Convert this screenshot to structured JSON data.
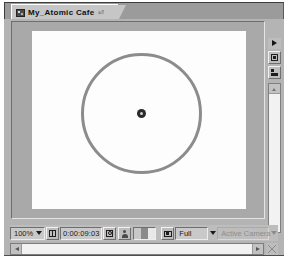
{
  "panel": {
    "name": "composition-viewer-panel",
    "accent_color": "#b4b4b4"
  },
  "tab": {
    "label": "My_Atomic Cafe",
    "modified_marker": "⏎",
    "icon": "composition-icon"
  },
  "canvas": {
    "background_color": "#fdfdfd",
    "pasteboard_color": "#a9a9a9",
    "shapes": [
      {
        "type": "ellipse",
        "name": "circle-shape",
        "stroke_color": "#8c8c8c",
        "stroke_width": 3,
        "fill": "none"
      },
      {
        "type": "anchor-point",
        "name": "anchor-point",
        "color": "#2a2a2a"
      }
    ]
  },
  "side_rail": {
    "items": [
      {
        "name": "panel-menu-button",
        "icon": "panel-menu-triangle-icon"
      },
      {
        "name": "region-of-interest-button",
        "icon": "region-of-interest-icon"
      },
      {
        "name": "three-d-view-button",
        "icon": "three-d-axis-icon"
      }
    ],
    "scrollbar": {
      "name": "vertical-scrollbar",
      "up_arrow": "scroll-up-arrow-icon"
    }
  },
  "toolbar": {
    "magnification": "100%",
    "magnification_arrow": "chevron-down-icon",
    "grid_guides_button": "grid-and-guides-icon",
    "timecode": "0:00:09:03",
    "mask_button": "toggle-mask-visibility-icon",
    "snapshot_button": "take-snapshot-icon",
    "channel_swatches": [
      "#c8c8c8",
      "#8a8a8a",
      "#e8e8e8"
    ],
    "view_layout_button": "view-layout-icon",
    "resolution": "Full",
    "resolution_arrow": "chevron-down-icon",
    "camera": "Active Camera",
    "camera_arrow": "chevron-down-icon"
  },
  "scrollbar_h": {
    "name": "horizontal-scrollbar",
    "left_arrow": "scroll-left-arrow-icon",
    "right_arrow": "scroll-right-arrow-icon",
    "resize_grip": "resize-grip-icon"
  }
}
